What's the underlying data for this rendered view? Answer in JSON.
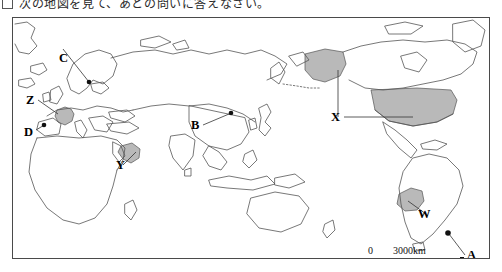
{
  "question": {
    "box_marker": "",
    "text": "次の地図を見て、あとの問いに答えなさい。"
  },
  "map": {
    "title": "World map (Asia-centred Miller projection)",
    "shaded_color": "#b9b9b9",
    "outline_color": "#555555",
    "frame_color": "#4a4a4a",
    "labels": [
      {
        "id": "C",
        "text": "C",
        "x": 50,
        "y": 41,
        "kind": "point-label",
        "refers_to": "Copenhagen / southern Scandinavia dot"
      },
      {
        "id": "Z",
        "text": "Z",
        "x": 13,
        "y": 88,
        "kind": "country-label",
        "refers_to": "France (shaded)"
      },
      {
        "id": "D",
        "text": "D",
        "x": 11,
        "y": 118,
        "kind": "point-label",
        "refers_to": "Lisbon / Iberia dot"
      },
      {
        "id": "B",
        "text": "B",
        "x": 178,
        "y": 112,
        "kind": "point-label",
        "refers_to": "Beijing dot"
      },
      {
        "id": "Y",
        "text": "Y",
        "x": 107,
        "y": 152,
        "kind": "country-label",
        "refers_to": "Arabian Peninsula (shaded)"
      },
      {
        "id": "X",
        "text": "X",
        "x": 327,
        "y": 104,
        "kind": "country-label",
        "refers_to": "United States incl. Alaska (shaded)"
      },
      {
        "id": "W",
        "text": "W",
        "x": 406,
        "y": 201,
        "kind": "country-label",
        "refers_to": "Peru / Bolivia (shaded)"
      },
      {
        "id": "A",
        "text": "A",
        "x": 451,
        "y": 241,
        "kind": "point-label",
        "refers_to": "Buenos Aires dot"
      }
    ],
    "scale": {
      "zero": "0",
      "distance": "3000km"
    }
  }
}
